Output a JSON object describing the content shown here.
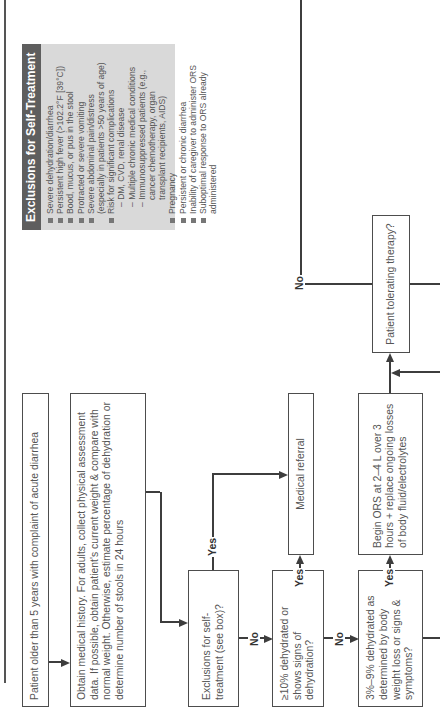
{
  "exclusions": {
    "title": "Exclusions for Self-Treatment",
    "items": [
      {
        "text": "Severe dehydration/diarrhea",
        "level": 0
      },
      {
        "text": "Persistent high fever (>102.2°F [39°C])",
        "level": 0
      },
      {
        "text": "Bood, mucus, or pus in the stool",
        "level": 0
      },
      {
        "text": "Protracted or severe vomiting",
        "level": 0
      },
      {
        "text": "Severe abdominal pain/distress",
        "level": 0
      },
      {
        "text": "(especially in patients >50 years of age)",
        "level": 1
      },
      {
        "text": "Risk for significant complications",
        "level": 0
      },
      {
        "text": "– DM, CVD, renal disease",
        "level": 2
      },
      {
        "text": "– Multiple chronic medical conditions",
        "level": 2
      },
      {
        "text": "– Immunosuppressed patients (e.g.,",
        "level": 2
      },
      {
        "text": "cancer chemotherapy, organ",
        "level": 3
      },
      {
        "text": "transplant recipients, AIDS)",
        "level": 3
      },
      {
        "text": "Pregnancy",
        "level": 0
      },
      {
        "text": "Persistent or chronic diarrhea",
        "level": 0
      },
      {
        "text": "Inability of caregiver to administer ORS",
        "level": 0
      },
      {
        "text": "Suboptimal response to ORS already",
        "level": 0
      },
      {
        "text": "administered",
        "level": 1
      }
    ]
  },
  "nodes": {
    "start": "Patient older than 5 years with complaint of acute diarrhea",
    "history": "Obtain medical history. For adults, collect physical assessment data. If possible, obtain patient's current weight & compare with normal weight. Otherwise, estimate percentage of dehydration or determine number of stools in 24 hours",
    "exclusions_q": "Exclusions for self-treatment (see box)?",
    "severe_q": "≥10% dehydrated or shows signs of dehydration?",
    "moderate_q": "3%–9% dehydrated as determined by body weight loss or signs & symptoms?",
    "referral": "Medical referral",
    "ors": "Begin ORS at 2–4 L over 3 hours + replace ongoing losses of body fluid/electrolytes",
    "tolerating_q": "Patient tolerating therapy?"
  },
  "labels": {
    "yes": "Yes",
    "no": "No"
  }
}
